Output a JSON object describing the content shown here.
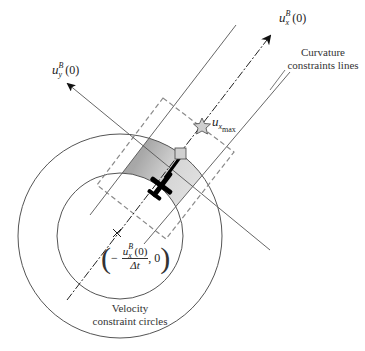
{
  "diagram": {
    "labels": {
      "ux_axis": {
        "base": "u",
        "sub": "x",
        "sup": "B",
        "arg": "(0)"
      },
      "uy_axis": {
        "base": "u",
        "sub": "y",
        "sup": "B",
        "arg": "(0)"
      },
      "uxmax": {
        "base": "u",
        "sub": "x",
        "subsub": "max"
      },
      "curvature": {
        "line1": "Curvature",
        "line2": "constraints lines"
      },
      "velocity": {
        "line1": "Velocity",
        "line2": "constraint circles"
      },
      "center_point": {
        "minus": "−",
        "numerator": "u",
        "num_sub": "x",
        "num_sup": "B",
        "num_arg": "(0)",
        "denominator": "Δt",
        "second": ", 0"
      }
    },
    "colors": {
      "line": "#555555",
      "dashed_box": "#8a8a8a",
      "shade_dark": "#8c8c8c",
      "shade_light": "#f2f2f2",
      "marker_fill": "#cfcfcf",
      "aircraft": "#000000"
    },
    "geometry": {
      "circle_center": [
        120,
        236
      ],
      "outer_radius": 102,
      "inner_radius": 63
    }
  }
}
